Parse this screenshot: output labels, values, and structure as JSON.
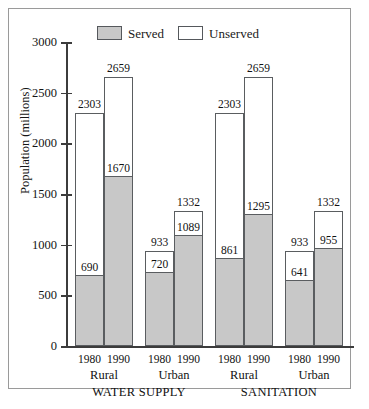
{
  "figure": {
    "frame_color": "#9a9a9a",
    "background": "#ffffff"
  },
  "legend": {
    "position": "top-center",
    "entries": [
      {
        "label": "Served",
        "swatch": "served-swatch",
        "color": "#c8c8c8"
      },
      {
        "label": "Unserved",
        "swatch": "unserved-swatch",
        "color": "#ffffff"
      }
    ]
  },
  "axes": {
    "ylabel": "Population (millions)",
    "yticks": [
      0,
      500,
      1000,
      1500,
      2000,
      2500,
      3000
    ],
    "ytick_labels": [
      "0",
      "500",
      "1000",
      "1500",
      "2000",
      "2500",
      "3000"
    ],
    "ylim": [
      0,
      3000
    ]
  },
  "groups": [
    {
      "name": "WATER SUPPLY",
      "subgroups": [
        {
          "name": "Rural",
          "years": [
            "1980",
            "1990"
          ]
        },
        {
          "name": "Urban",
          "years": [
            "1980",
            "1990"
          ]
        }
      ]
    },
    {
      "name": "SANITATION",
      "subgroups": [
        {
          "name": "Rural",
          "years": [
            "1980",
            "1990"
          ]
        },
        {
          "name": "Urban",
          "years": [
            "1980",
            "1990"
          ]
        }
      ]
    }
  ],
  "chart_data": {
    "type": "bar",
    "subtype": "stacked-bar",
    "title": "",
    "xlabel": "",
    "ylabel": "Population (millions)",
    "ylim": [
      0,
      3000
    ],
    "yticks": [
      0,
      500,
      1000,
      1500,
      2000,
      2500,
      3000
    ],
    "grid": false,
    "legend_position": "top-center",
    "categories": [
      "WATER SUPPLY / Rural / 1980",
      "WATER SUPPLY / Rural / 1990",
      "WATER SUPPLY / Urban / 1980",
      "WATER SUPPLY / Urban / 1990",
      "SANITATION / Rural / 1980",
      "SANITATION / Rural / 1990",
      "SANITATION / Urban / 1980",
      "SANITATION / Urban / 1990"
    ],
    "series": [
      {
        "name": "Served",
        "color": "#c8c8c8",
        "values": [
          690,
          1670,
          720,
          1089,
          861,
          1295,
          641,
          955
        ]
      },
      {
        "name": "Unserved",
        "color": "#ffffff",
        "values": [
          1613,
          989,
          213,
          243,
          1442,
          1364,
          292,
          377
        ]
      }
    ],
    "totals": [
      2303,
      2659,
      933,
      1332,
      2303,
      2659,
      933,
      1332
    ],
    "bars": [
      {
        "group": "WATER SUPPLY",
        "subgroup": "Rural",
        "year": "1980",
        "served": 690,
        "total": 2303,
        "served_label": "690",
        "total_label": "2303"
      },
      {
        "group": "WATER SUPPLY",
        "subgroup": "Rural",
        "year": "1990",
        "served": 1670,
        "total": 2659,
        "served_label": "1670",
        "total_label": "2659"
      },
      {
        "group": "WATER SUPPLY",
        "subgroup": "Urban",
        "year": "1980",
        "served": 720,
        "total": 933,
        "served_label": "720",
        "total_label": "933"
      },
      {
        "group": "WATER SUPPLY",
        "subgroup": "Urban",
        "year": "1990",
        "served": 1089,
        "total": 1332,
        "served_label": "1089",
        "total_label": "1332"
      },
      {
        "group": "SANITATION",
        "subgroup": "Rural",
        "year": "1980",
        "served": 861,
        "total": 2303,
        "served_label": "861",
        "total_label": "2303"
      },
      {
        "group": "SANITATION",
        "subgroup": "Rural",
        "year": "1990",
        "served": 1295,
        "total": 2659,
        "served_label": "1295",
        "total_label": "2659"
      },
      {
        "group": "SANITATION",
        "subgroup": "Urban",
        "year": "1980",
        "served": 641,
        "total": 933,
        "served_label": "641",
        "total_label": "933"
      },
      {
        "group": "SANITATION",
        "subgroup": "Urban",
        "year": "1990",
        "served": 955,
        "total": 1332,
        "served_label": "955",
        "total_label": "1332"
      }
    ]
  }
}
